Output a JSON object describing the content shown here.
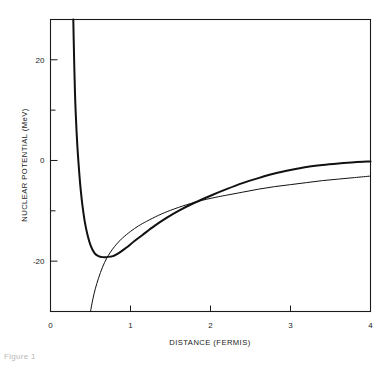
{
  "figure": {
    "caption": "Figure 1"
  },
  "chart_data": {
    "type": "line",
    "title": "",
    "xlabel": "DISTANCE (FERMIS)",
    "ylabel": "NUCLEAR POTENTIAL (MeV)",
    "xlim": [
      0,
      4
    ],
    "ylim": [
      -30,
      28
    ],
    "grid": false,
    "legend": "none",
    "x_ticks": [
      0,
      1,
      2,
      3,
      4
    ],
    "x_tick_labels": [
      "0",
      "1",
      "2",
      "3",
      "4"
    ],
    "y_ticks": [
      -20,
      -10,
      0,
      10,
      20
    ],
    "y_tick_labels": [
      "-20",
      "",
      "0",
      "",
      "20"
    ],
    "y_labeled_ticks": [
      -20,
      0,
      20
    ],
    "series": [
      {
        "name": "hard-core potential",
        "style": "thick",
        "x": [
          0.285,
          0.29,
          0.3,
          0.31,
          0.325,
          0.34,
          0.36,
          0.38,
          0.4,
          0.43,
          0.46,
          0.5,
          0.55,
          0.6,
          0.65,
          0.7,
          0.75,
          0.78,
          0.82,
          0.88,
          0.95,
          1.05,
          1.15,
          1.3,
          1.45,
          1.6,
          1.8,
          2.0,
          2.2,
          2.4,
          2.6,
          2.8,
          3.0,
          3.2,
          3.4,
          3.6,
          3.8,
          4.0
        ],
        "y": [
          28.0,
          24.0,
          17.0,
          11.5,
          6.0,
          1.8,
          -2.6,
          -6.2,
          -9.0,
          -12.3,
          -14.6,
          -16.8,
          -18.4,
          -19.0,
          -19.2,
          -19.2,
          -19.1,
          -19.0,
          -18.7,
          -18.1,
          -17.3,
          -16.0,
          -14.8,
          -13.0,
          -11.4,
          -10.0,
          -8.4,
          -7.0,
          -5.7,
          -4.5,
          -3.5,
          -2.6,
          -1.9,
          -1.3,
          -0.9,
          -0.6,
          -0.35,
          -0.2
        ]
      },
      {
        "name": "soft-core potential",
        "style": "thin",
        "x": [
          0.5,
          0.53,
          0.56,
          0.6,
          0.65,
          0.7,
          0.75,
          0.8,
          0.85,
          0.9,
          1.0,
          1.1,
          1.2,
          1.35,
          1.5,
          1.7,
          1.9,
          2.1,
          2.2,
          2.4,
          2.6,
          2.8,
          3.0,
          3.2,
          3.4,
          3.6,
          3.8,
          4.0
        ],
        "y": [
          -30.0,
          -27.5,
          -25.5,
          -23.4,
          -21.2,
          -19.5,
          -18.2,
          -17.1,
          -16.2,
          -15.4,
          -14.1,
          -13.0,
          -12.1,
          -10.9,
          -9.9,
          -8.8,
          -7.9,
          -7.2,
          -6.9,
          -6.3,
          -5.7,
          -5.2,
          -4.8,
          -4.4,
          -4.0,
          -3.7,
          -3.4,
          -3.1
        ]
      }
    ],
    "annotations": {
      "minimum_thick_x": 0.78,
      "minimum_thick_y": -19.2,
      "asymptote_thick_x": 0.285,
      "crossover_x": 2.2,
      "crossover_y": -6.9
    }
  }
}
